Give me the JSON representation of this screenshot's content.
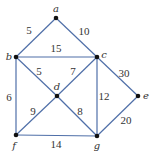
{
  "diagram": {
    "type": "weighted-graph",
    "vertices": [
      {
        "id": "a",
        "label": "a",
        "x": 56,
        "y": 18,
        "lx": 56,
        "ly": 12
      },
      {
        "id": "b",
        "label": "b",
        "x": 16,
        "y": 57,
        "lx": 9,
        "ly": 60
      },
      {
        "id": "c",
        "label": "c",
        "x": 97,
        "y": 57,
        "lx": 104,
        "ly": 58
      },
      {
        "id": "d",
        "label": "d",
        "x": 57,
        "y": 96,
        "lx": 57,
        "ly": 90
      },
      {
        "id": "e",
        "label": "e",
        "x": 138,
        "y": 96,
        "lx": 146,
        "ly": 99
      },
      {
        "id": "f",
        "label": "f",
        "x": 16,
        "y": 135,
        "lx": 14,
        "ly": 149
      },
      {
        "id": "g",
        "label": "g",
        "x": 97,
        "y": 136,
        "lx": 97,
        "ly": 149
      }
    ],
    "edges": [
      {
        "from": "a",
        "to": "b",
        "weight": "5",
        "lx": 29,
        "ly": 34
      },
      {
        "from": "a",
        "to": "c",
        "weight": "10",
        "lx": 84,
        "ly": 35
      },
      {
        "from": "b",
        "to": "c",
        "weight": "15",
        "lx": 56,
        "ly": 52
      },
      {
        "from": "b",
        "to": "d",
        "weight": "5",
        "lx": 39,
        "ly": 75
      },
      {
        "from": "c",
        "to": "d",
        "weight": "7",
        "lx": 73,
        "ly": 75
      },
      {
        "from": "c",
        "to": "e",
        "weight": "30",
        "lx": 124,
        "ly": 77
      },
      {
        "from": "b",
        "to": "f",
        "weight": "6",
        "lx": 9,
        "ly": 101
      },
      {
        "from": "c",
        "to": "g",
        "weight": "12",
        "lx": 104,
        "ly": 100
      },
      {
        "from": "d",
        "to": "f",
        "weight": "9",
        "lx": 33,
        "ly": 115
      },
      {
        "from": "d",
        "to": "g",
        "weight": "8",
        "lx": 80,
        "ly": 115
      },
      {
        "from": "e",
        "to": "g",
        "weight": "20",
        "lx": 126,
        "ly": 124
      },
      {
        "from": "f",
        "to": "g",
        "weight": "14",
        "lx": 56,
        "ly": 148
      }
    ],
    "colors": {
      "edge": "#4f6fa8",
      "vertex": "#111111",
      "text": "#333333"
    }
  }
}
